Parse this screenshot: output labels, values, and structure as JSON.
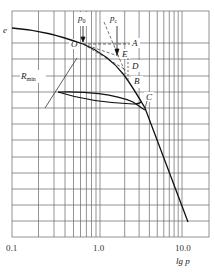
{
  "figure": {
    "type": "e-lgp compression curve diagram (Casagrande construction)",
    "y_axis_label": "e",
    "x_axis_label": "lg p",
    "x_ticks": [
      "0.1",
      "1.0",
      "10.0"
    ],
    "x_scale": "log",
    "x_range": [
      0.1,
      20
    ],
    "grid": true,
    "annotations": {
      "p0": "p",
      "p0_sub": "0",
      "pc": "p",
      "pc_sub": "c",
      "point_O": "O",
      "point_A": "A",
      "point_E": "E",
      "point_D": "D",
      "point_B": "B",
      "point_C": "C",
      "rmin": "R",
      "rmin_sub": "min"
    },
    "colors": {
      "grid": "#555555",
      "curve": "#111111",
      "construction": "#333333",
      "background": "#ffffff"
    }
  }
}
